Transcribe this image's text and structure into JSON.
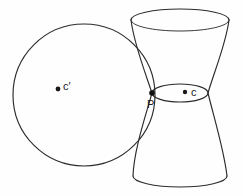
{
  "figure": {
    "background_color": "#fefefe",
    "stroke_color": "#2b2b2b",
    "width": 243,
    "height": 196,
    "labels": {
      "circle_center": "c′",
      "waist_center": "c",
      "tangency_point": "P"
    },
    "elements": {
      "circle_name": "great circle of sphere",
      "surface_name": "hyperboloid of one sheet",
      "waist_name": "waist ellipse (throat)",
      "top_rim_name": "top rim ellipse",
      "bottom_rim_name": "bottom rim arc"
    }
  },
  "geometry": {
    "circle": {
      "cx": 84,
      "cy": 95,
      "r": 71
    },
    "top_rim": {
      "cx": 180,
      "cy": 20,
      "rx": 49,
      "ry": 11
    },
    "waist": {
      "cx": 180,
      "cy": 93,
      "rx": 28,
      "ry": 9
    },
    "bottom_rim": {
      "cx": 180,
      "cy": 176,
      "rx": 47,
      "ry": 11
    },
    "point_c_prime": {
      "x": 58,
      "y": 89
    },
    "point_c": {
      "x": 185,
      "y": 92
    },
    "point_P": {
      "x": 152,
      "y": 93
    }
  }
}
